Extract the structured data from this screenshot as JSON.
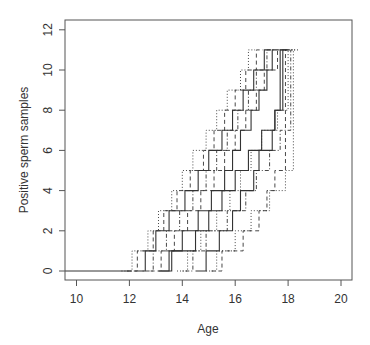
{
  "chart_data": {
    "type": "line",
    "subtype": "step",
    "title": "",
    "xlabel": "Age",
    "ylabel": "Positive sperm samples",
    "xlim": [
      9.6,
      20.4
    ],
    "ylim": [
      -0.5,
      12.5
    ],
    "xticks": [
      10,
      12,
      14,
      16,
      18,
      20
    ],
    "yticks": [
      0,
      2,
      4,
      6,
      8,
      10,
      12
    ],
    "grid": false,
    "legend": null,
    "line_color": "#333333",
    "series": [
      {
        "name": "trajectory-1",
        "style": "solid",
        "steps": [
          12.6,
          13.0,
          13.5,
          14.1,
          14.6,
          15.0,
          15.5,
          15.9,
          16.3,
          16.7,
          17.1
        ]
      },
      {
        "name": "trajectory-2",
        "style": "solid",
        "steps": [
          13.5,
          14.0,
          14.6,
          15.1,
          15.6,
          15.9,
          16.2,
          16.6,
          16.9,
          17.2,
          17.4
        ]
      },
      {
        "name": "trajectory-3",
        "style": "solid",
        "steps": [
          14.9,
          15.4,
          15.9,
          16.2,
          16.7,
          16.9,
          17.4,
          17.5,
          17.8,
          17.2,
          17.5
        ]
      },
      {
        "name": "trajectory-4",
        "style": "solid",
        "steps": [
          13.6,
          14.5,
          15.0,
          15.5,
          16.0,
          16.5,
          17.0,
          17.5,
          17.7,
          17.0,
          17.3
        ]
      },
      {
        "name": "trajectory-5",
        "style": "dashed",
        "steps": [
          12.3,
          12.9,
          13.3,
          13.8,
          14.3,
          14.8,
          15.2,
          15.6,
          16.0,
          16.4,
          16.8
        ]
      },
      {
        "name": "trajectory-6",
        "style": "dashed",
        "steps": [
          13.2,
          13.7,
          14.2,
          14.7,
          15.2,
          15.6,
          16.0,
          16.4,
          16.8,
          17.1,
          17.6
        ]
      },
      {
        "name": "trajectory-7",
        "style": "dashed",
        "steps": [
          15.5,
          16.3,
          16.9,
          17.2,
          17.5,
          17.9,
          17.6,
          17.8,
          16.5,
          17.0,
          17.3
        ]
      },
      {
        "name": "trajectory-8",
        "style": "dotted",
        "steps": [
          12.1,
          12.7,
          13.1,
          13.6,
          14.0,
          14.4,
          14.9,
          15.3,
          15.7,
          16.2,
          16.5
        ]
      },
      {
        "name": "trajectory-9",
        "style": "dotted",
        "steps": [
          14.2,
          14.7,
          15.3,
          15.8,
          16.2,
          16.6,
          17.0,
          17.6,
          18.0,
          16.6,
          17.3
        ]
      },
      {
        "name": "trajectory-10",
        "style": "dotted",
        "steps": [
          15.3,
          16.0,
          16.6,
          17.3,
          17.9,
          18.2,
          17.9,
          18.0,
          16.8,
          17.0,
          17.4
        ]
      },
      {
        "name": "trajectory-11",
        "style": "dotdash",
        "steps": [
          12.9,
          13.4,
          13.9,
          14.4,
          14.9,
          15.3,
          15.7,
          16.1,
          16.5,
          16.8,
          17.2
        ]
      },
      {
        "name": "trajectory-12",
        "style": "dotdash",
        "steps": [
          14.4,
          14.9,
          15.7,
          16.4,
          16.8,
          17.3,
          17.7,
          18.1,
          17.5,
          17.1,
          17.5
        ]
      }
    ]
  }
}
